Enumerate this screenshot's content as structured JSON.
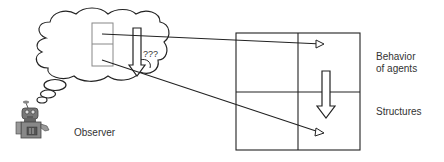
{
  "diagram": {
    "labels": {
      "observer": "Observer",
      "behavior_line1": "Behavior",
      "behavior_line2": "of agents",
      "structures": "Structures",
      "question": "???"
    },
    "colors": {
      "stroke": "#222222",
      "grid_small": "#888888",
      "text": "#333333",
      "robot_body": "#777777",
      "robot_dark": "#444444"
    },
    "icons": [
      "robot-observer-icon",
      "thought-cloud-icon",
      "down-arrow-icon",
      "pointer-arrow-icon"
    ]
  }
}
